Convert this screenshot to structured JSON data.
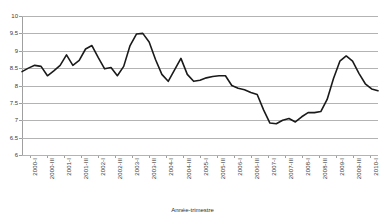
{
  "chart_data": {
    "type": "line",
    "title": "",
    "xlabel": "Année-trimestre",
    "ylabel": "",
    "ylim": [
      6,
      10
    ],
    "ytick_step": 0.5,
    "yticks": [
      "6",
      "6.5",
      "7",
      "7.5",
      "8",
      "8.5",
      "9",
      "9.5",
      "10"
    ],
    "grid": true,
    "legend": "none",
    "line_color": "#1a1a1a",
    "gridline_color": "#b3b3b3",
    "x": [
      "2000-I",
      "2000-II",
      "2000-III",
      "2000-IV",
      "2001-I",
      "2001-II",
      "2001-III",
      "2001-IV",
      "2002-I",
      "2002-II",
      "2002-III",
      "2002-IV",
      "2003-I",
      "2003-II",
      "2003-III",
      "2003-IV",
      "2004-I",
      "2004-II",
      "2004-III",
      "2004-IV",
      "2005-I",
      "2005-II",
      "2005-III",
      "2005-IV",
      "2006-I",
      "2006-II",
      "2006-III",
      "2006-IV",
      "2007-I",
      "2007-II",
      "2007-III",
      "2007-IV",
      "2008-I",
      "2008-II",
      "2008-III",
      "2008-IV",
      "2009-I",
      "2009-II",
      "2009-III",
      "2009-IV",
      "2010-I"
    ],
    "tick_labels": [
      "2000-I",
      "2000-III",
      "2001-I",
      "2001-III",
      "2002-I",
      "2002-III",
      "2003-I",
      "2003-III",
      "2004-I",
      "2004-III",
      "2005-I",
      "2005-III",
      "2006-I",
      "2006-III",
      "2007-I",
      "2007-III",
      "2008-I",
      "2008-III",
      "2009-I",
      "2009-III",
      "2010-I"
    ],
    "values": [
      8.4,
      8.5,
      8.58,
      8.55,
      8.28,
      8.42,
      8.58,
      8.88,
      8.58,
      8.72,
      9.05,
      9.15,
      8.8,
      8.48,
      8.52,
      8.28,
      8.55,
      9.15,
      9.48,
      9.5,
      9.25,
      8.75,
      8.32,
      8.12,
      8.45,
      8.78,
      8.32,
      8.12,
      8.15,
      8.22,
      8.26,
      8.28,
      8.28,
      8.0,
      7.92,
      7.88,
      7.8,
      7.74,
      7.3,
      6.92,
      6.9
    ],
    "values_note": "Quarterly series; continues after 2010-I index per plotted curve",
    "values_extended": [
      8.4,
      8.5,
      8.58,
      8.55,
      8.28,
      8.42,
      8.58,
      8.88,
      8.58,
      8.72,
      9.05,
      9.15,
      8.8,
      8.48,
      8.52,
      8.28,
      8.55,
      9.15,
      9.48,
      9.5,
      9.25,
      8.75,
      8.32,
      8.12,
      8.45,
      8.78,
      8.32,
      8.12,
      8.15,
      8.22,
      8.26,
      8.28,
      8.28,
      8.0,
      7.92,
      7.88,
      7.8,
      7.74,
      7.3,
      6.92,
      6.9,
      7.0,
      7.05,
      6.95,
      7.1,
      7.22,
      7.22,
      7.25,
      7.6,
      8.2,
      8.7,
      8.85,
      8.7,
      8.35,
      8.05,
      7.9,
      7.85
    ],
    "y_min_observed": 6.88,
    "y_max_observed": 9.5,
    "last_value": 7.85
  }
}
